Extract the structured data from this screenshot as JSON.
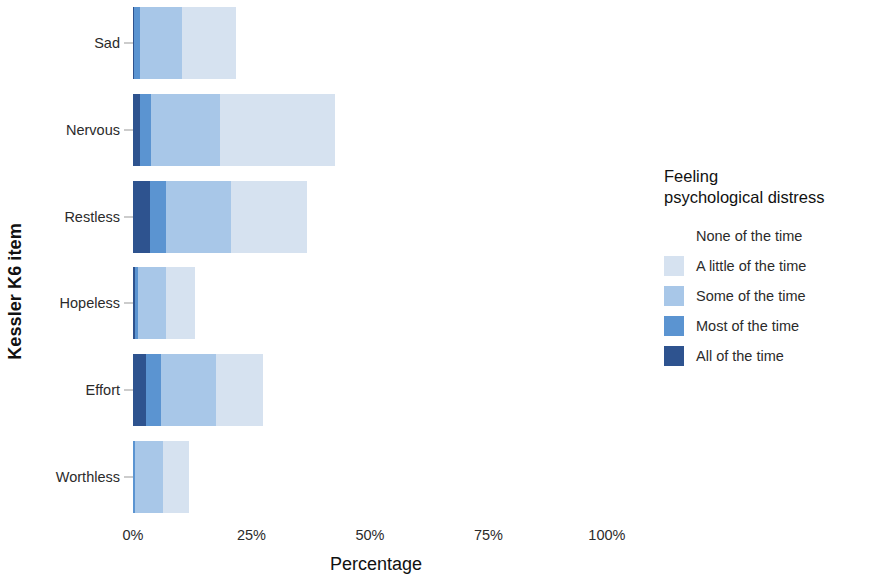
{
  "chart_data": {
    "type": "bar",
    "orientation": "horizontal",
    "stacked": true,
    "title": "",
    "xlabel": "Percentage",
    "ylabel": "Kessler K6 item",
    "categories": [
      "Sad",
      "Nervous",
      "Restless",
      "Hopeless",
      "Effort",
      "Worthless"
    ],
    "xlim": [
      0,
      100
    ],
    "xticks": [
      0,
      25,
      50,
      75,
      100
    ],
    "xtick_labels": [
      "0%",
      "25%",
      "50%",
      "75%",
      "100%"
    ],
    "grid": false,
    "legend_position": "right",
    "legend_title": "Feeling\npsychological distress",
    "series": [
      {
        "name": "None of the time",
        "color": "#ffffff",
        "values": [
          78.3,
          57.4,
          63.3,
          86.9,
          72.6,
          88.2
        ]
      },
      {
        "name": "A little of the time",
        "color": "#d6e2f0",
        "values": [
          11.4,
          24.3,
          16.0,
          6.1,
          9.9,
          5.5
        ]
      },
      {
        "name": "Some of the time",
        "color": "#a8c7e8",
        "values": [
          8.9,
          14.5,
          13.7,
          5.9,
          11.6,
          5.9
        ]
      },
      {
        "name": "Most of the time",
        "color": "#5b94d1",
        "values": [
          1.1,
          2.3,
          3.4,
          0.7,
          3.2,
          0.3
        ]
      },
      {
        "name": "All of the time",
        "color": "#2e538f",
        "values": [
          0.3,
          1.5,
          3.6,
          0.4,
          2.7,
          0.1
        ]
      }
    ]
  },
  "axes": {
    "y_title": "Kessler K6 item",
    "x_title": "Percentage"
  }
}
